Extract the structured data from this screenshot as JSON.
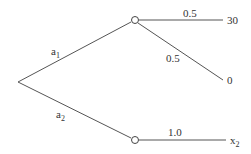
{
  "diagram": {
    "type": "decision-tree",
    "root": {
      "x": 18,
      "y": 82
    },
    "decisions": [
      {
        "label": "a",
        "subscript": "1",
        "to_node": "chance_top"
      },
      {
        "label": "a",
        "subscript": "2",
        "to_node": "chance_bottom"
      }
    ],
    "chance_nodes": {
      "chance_top": {
        "x": 135,
        "y": 20
      },
      "chance_bottom": {
        "x": 135,
        "y": 140
      }
    },
    "outcomes": [
      {
        "from": "chance_top",
        "probability": "0.5",
        "payoff": "30"
      },
      {
        "from": "chance_top",
        "probability": "0.5",
        "payoff": "0"
      },
      {
        "from": "chance_bottom",
        "probability": "1.0",
        "payoff": "x",
        "payoff_subscript": "2"
      }
    ]
  }
}
